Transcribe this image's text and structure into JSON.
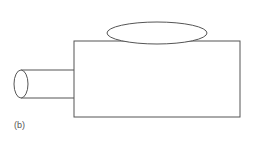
{
  "figure": {
    "label": "(b)",
    "stroke_color": "#555555",
    "shapes": [
      "main-box",
      "top-ellipse",
      "side-cylinder"
    ]
  }
}
